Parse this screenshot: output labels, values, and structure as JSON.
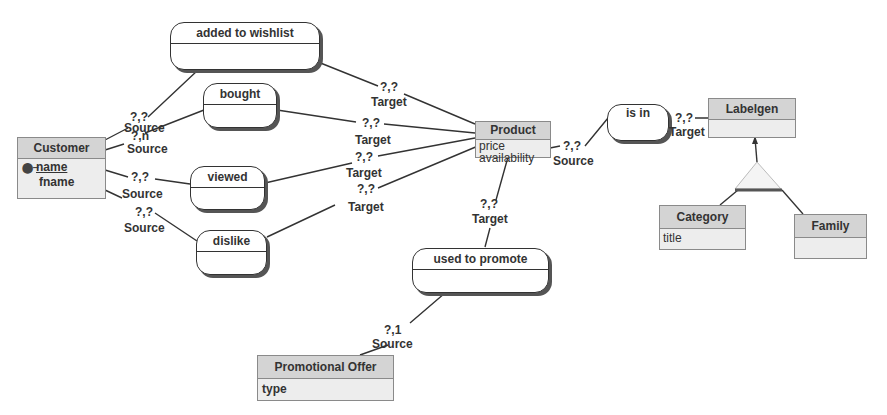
{
  "diagram": {
    "type": "entity-relationship",
    "entities": [
      {
        "id": "customer",
        "name": "Customer",
        "attributes": [
          {
            "name": "name",
            "primary_key": true
          },
          {
            "name": "fname",
            "primary_key": false
          }
        ]
      },
      {
        "id": "product",
        "name": "Product",
        "attributes": [
          {
            "name": "price"
          },
          {
            "name": "availability"
          }
        ]
      },
      {
        "id": "labelgen",
        "name": "Labelgen",
        "attributes": []
      },
      {
        "id": "category",
        "name": "Category",
        "attributes": [
          {
            "name": "title"
          }
        ]
      },
      {
        "id": "family",
        "name": "Family",
        "attributes": []
      },
      {
        "id": "promotional_offer",
        "name": "Promotional Offer",
        "attributes": [
          {
            "name": "type"
          }
        ]
      }
    ],
    "relationships": [
      {
        "id": "wishlist",
        "name": "added to wishlist",
        "source": {
          "entity": "Customer",
          "cardinality": "?,?",
          "role": "Source"
        },
        "target": {
          "entity": "Product",
          "cardinality": "?,?",
          "role": "Target"
        }
      },
      {
        "id": "bought",
        "name": "bought",
        "source": {
          "entity": "Customer",
          "cardinality": "?,n",
          "role": "Source"
        },
        "target": {
          "entity": "Product",
          "cardinality": "?,?",
          "role": "Target"
        }
      },
      {
        "id": "viewed",
        "name": "viewed",
        "source": {
          "entity": "Customer",
          "cardinality": "?,?",
          "role": "Source"
        },
        "target": {
          "entity": "Product",
          "cardinality": "?,?",
          "role": "Target"
        }
      },
      {
        "id": "dislike",
        "name": "dislike",
        "source": {
          "entity": "Customer",
          "cardinality": "?,?",
          "role": "Source"
        },
        "target": {
          "entity": "Product",
          "cardinality": "?,?",
          "role": "Target"
        }
      },
      {
        "id": "is_in",
        "name": "is in",
        "source": {
          "entity": "Product",
          "cardinality": "?,?",
          "role": "Source"
        },
        "target": {
          "entity": "Labelgen",
          "cardinality": "?,?",
          "role": "Target"
        }
      },
      {
        "id": "promote",
        "name": "used to promote",
        "source": {
          "entity": "Promotional Offer",
          "cardinality": "?,1",
          "role": "Source"
        },
        "target": {
          "entity": "Product",
          "cardinality": "?,?",
          "role": "Target"
        }
      }
    ],
    "generalization": {
      "parent": "Labelgen",
      "children": [
        "Category",
        "Family"
      ]
    }
  },
  "labels": {
    "source": "Source",
    "target": "Target",
    "card_qq": "?,?",
    "card_qn": "?,n",
    "card_q1": "?,1"
  },
  "colors": {
    "entity_header": "#d4d4d4",
    "entity_body": "#ededed",
    "entity_border": "#8a8a8a",
    "line": "#333333",
    "background": "#ffffff"
  }
}
